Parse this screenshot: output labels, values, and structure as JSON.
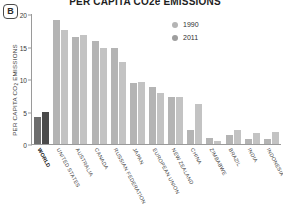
{
  "panel": {
    "label": "B"
  },
  "title": {
    "text": "PER CAPITA CO2e EMISSIONS"
  },
  "axis": {
    "ylabel_main": "PER CAPITA CO",
    "ylabel_sub": "2",
    "ylabel_tail": " EMISSIONS"
  },
  "legend": {
    "position": "inside-top-right",
    "items": [
      {
        "label": "1990",
        "color": "#b4b4b4"
      },
      {
        "label": "2011",
        "color": "#9e9e9e"
      }
    ]
  },
  "chart_data": {
    "type": "bar",
    "title": "PER CAPITA CO2e EMISSIONS",
    "xlabel": "",
    "ylabel": "PER CAPITA CO2 EMISSIONS",
    "ylim": [
      0,
      20
    ],
    "yticks": [
      0,
      5,
      10,
      15,
      20
    ],
    "grid": false,
    "legend_position": "inside-top-right",
    "categories": [
      "WORLD",
      "UNITED STATES",
      "AUSTRALIA",
      "CANADA",
      "RUSSIAN FEDERATION",
      "JAPAN",
      "EUROPEAN UNION",
      "NEW ZEALAND",
      "CHINA",
      "ZIMBABWE",
      "BRAZIL",
      "INDIA",
      "INDONESIA"
    ],
    "series": [
      {
        "name": "1990",
        "color": "#b4b4b4",
        "values": [
          4.2,
          19.1,
          16.5,
          15.8,
          14.7,
          9.4,
          8.8,
          7.2,
          2.1,
          0.9,
          1.4,
          0.8,
          0.8
        ]
      },
      {
        "name": "2011",
        "color": "#c3c3c3",
        "values": [
          4.9,
          17.6,
          16.8,
          14.7,
          12.6,
          9.6,
          7.8,
          7.2,
          6.2,
          0.5,
          2.2,
          1.7,
          1.8
        ]
      }
    ]
  }
}
